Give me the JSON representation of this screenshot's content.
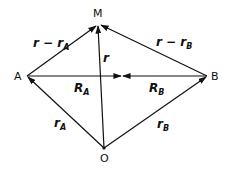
{
  "diagram": {
    "points": {
      "M": {
        "label": "M",
        "x": 98,
        "y": 24
      },
      "A": {
        "label": "A",
        "x": 27,
        "y": 76
      },
      "B": {
        "label": "B",
        "x": 207,
        "y": 76
      },
      "O": {
        "label": "O",
        "x": 104,
        "y": 148
      }
    },
    "vectors": {
      "r_minus_rA": {
        "main": "r − r",
        "sub": "A",
        "from": "A",
        "to": "M"
      },
      "r_minus_rB": {
        "main": "r − r",
        "sub": "B",
        "from": "B",
        "to": "M"
      },
      "r": {
        "main": "r",
        "from": "O",
        "to": "M"
      },
      "RA": {
        "main": "R",
        "sub": "A",
        "from": "A",
        "to": "C"
      },
      "RB": {
        "main": "R",
        "sub": "B",
        "from": "B",
        "to": "C"
      },
      "rA": {
        "main": "r",
        "sub": "A",
        "from": "O",
        "to": "A"
      },
      "rB": {
        "main": "r",
        "sub": "B",
        "from": "O",
        "to": "B"
      }
    },
    "colors": {
      "line": "#111111",
      "background": "#ffffff"
    }
  }
}
